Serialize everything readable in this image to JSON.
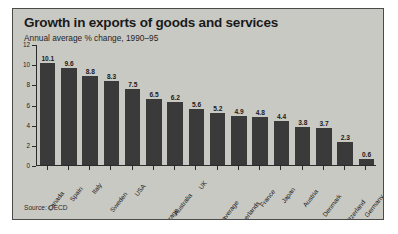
{
  "chart_data": {
    "type": "bar",
    "title": "Growth in exports of goods and services",
    "subtitle": "Annual average % change, 1990–95",
    "source": "Source: OECD",
    "xlabel": "",
    "ylabel": "",
    "ylim": [
      0,
      12
    ],
    "yticks": [
      12,
      10,
      8,
      6,
      4,
      2,
      0
    ],
    "grid": false,
    "legend": "none",
    "bar_color": "#3a3a3a",
    "panel_color": "#c9c9c4",
    "axis_color": "#2b2b2b",
    "categories": [
      "Canada",
      "Spain",
      "Italy",
      "Sweden",
      "USA",
      "OECD average",
      "Australia",
      "UK",
      "EU average",
      "Netherlands",
      "France",
      "Japan",
      "Austria",
      "Denmark",
      "Switzerland",
      "Germany"
    ],
    "values": [
      10.1,
      9.6,
      8.8,
      8.3,
      7.5,
      6.5,
      6.2,
      5.6,
      5.2,
      4.9,
      4.8,
      4.4,
      3.8,
      3.7,
      2.3,
      0.6
    ]
  }
}
